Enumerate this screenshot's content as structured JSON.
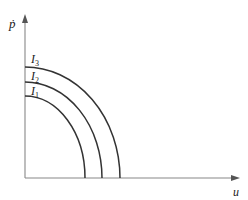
{
  "diagram": {
    "type": "isoquant-curves",
    "axes": {
      "y_label": "ṗ",
      "x_label": "u"
    },
    "curves": [
      {
        "label": "I",
        "subscript": "1",
        "y_intercept_px": 96,
        "x_intercept_px": 85
      },
      {
        "label": "I",
        "subscript": "2",
        "y_intercept_px": 82,
        "x_intercept_px": 102
      },
      {
        "label": "I",
        "subscript": "3",
        "y_intercept_px": 67,
        "x_intercept_px": 120
      }
    ],
    "colors": {
      "axis": "#888888",
      "curve": "#333333"
    }
  }
}
